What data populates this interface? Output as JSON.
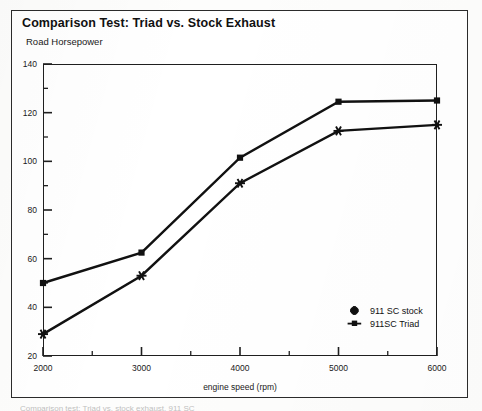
{
  "page": {
    "bottom_caption": "Comparison test: Triad vs. stock exhaust, 911 SC"
  },
  "chart_data": {
    "type": "line",
    "title": "Comparison Test: Triad vs. Stock Exhaust",
    "subtitle": "Road Horsepower",
    "xlabel": "engine speed (rpm)",
    "ylabel": "",
    "xlim": [
      2000,
      6000
    ],
    "ylim": [
      20,
      140
    ],
    "xticks": [
      2000,
      3000,
      4000,
      5000,
      6000
    ],
    "yticks": [
      20,
      40,
      60,
      80,
      100,
      120,
      140
    ],
    "xminor_step": 500,
    "yminor_step": 10,
    "grid": false,
    "legend_position": "inside-bottom-right",
    "x": [
      2000,
      3000,
      4000,
      5000,
      6000
    ],
    "series": [
      {
        "name": "911SC Triad",
        "marker": "square",
        "values": [
          50,
          62.5,
          101.5,
          124.5,
          125
        ]
      },
      {
        "name": "911 SC stock",
        "marker": "star",
        "values": [
          29,
          53,
          91,
          112.5,
          115
        ]
      }
    ]
  },
  "legend": {
    "entries": [
      {
        "label": "911 SC stock",
        "marker": "star"
      },
      {
        "label": "911SC Triad",
        "marker": "square"
      }
    ]
  }
}
